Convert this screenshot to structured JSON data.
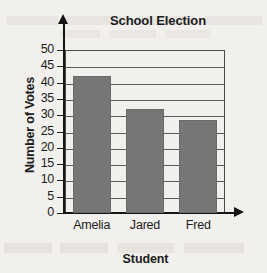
{
  "chart_data": {
    "type": "bar",
    "title": "School Election",
    "xlabel": "Student",
    "ylabel": "Number of Votes",
    "categories": [
      "Amelia",
      "Jared",
      "Fred"
    ],
    "values": [
      42,
      32,
      28.5
    ],
    "ylim": [
      0,
      50
    ],
    "ytick_labels": [
      "0",
      "5",
      "10",
      "15",
      "20",
      "25",
      "30",
      "35",
      "40",
      "45",
      "50"
    ],
    "ytick_values": [
      0,
      5,
      10,
      15,
      20,
      25,
      30,
      35,
      40,
      45,
      50
    ],
    "ytick_step": 5,
    "grid": "horizontal",
    "legend": "none",
    "bar_color": "#767676",
    "axis_color": "#151515",
    "grid_color": "#5a5a5a",
    "text_color": "#1c1c1c",
    "background_color": "#f2f0ec"
  }
}
